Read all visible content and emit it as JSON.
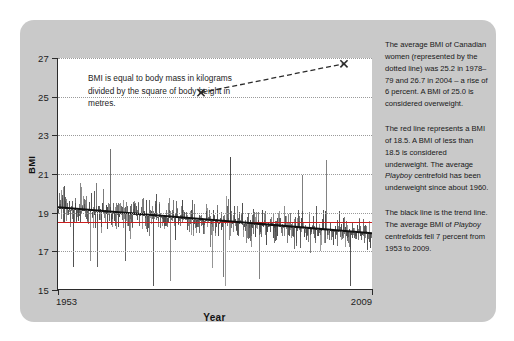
{
  "chart_data": {
    "type": "line",
    "title": "",
    "xlabel": "Year",
    "ylabel": "BMI",
    "xlim": [
      1953,
      2009
    ],
    "ylim": [
      15,
      27
    ],
    "yticks": [
      15,
      17,
      19,
      21,
      23,
      25,
      27
    ],
    "xticks": [
      1953,
      2009
    ],
    "xtick_labels": [
      "1953",
      "2009"
    ],
    "grid": "horizontal dotted gridlines at each y tick",
    "legend": "none (series described in side notes)",
    "series": [
      {
        "name": "Playboy centrefold BMI",
        "style": "dense gray vertical spikes (monthly issues)",
        "color": "#4a4a4a",
        "note": "Fell 7 percent from 1953 to 2009",
        "approx_start_value": 19.2,
        "approx_end_value": 17.9,
        "approx_min_value": 15.2,
        "approx_max_value": 23.2
      },
      {
        "name": "Underweight threshold",
        "style": "horizontal line",
        "color": "#cc1f1f",
        "value": 18.5
      },
      {
        "name": "Trend line",
        "style": "straight black line",
        "color": "#111111",
        "start": {
          "x": 1953,
          "y": 19.25
        },
        "end": {
          "x": 2009,
          "y": 17.9
        }
      },
      {
        "name": "Average BMI of Canadian women",
        "style": "dotted line with X markers",
        "color": "#2b2b2b",
        "points": [
          {
            "label": "1978–79",
            "x": 1978.5,
            "y": 25.2
          },
          {
            "label": "2004",
            "x": 2004,
            "y": 26.7
          }
        ]
      }
    ],
    "annotation": "BMI is equal to body mass in kilograms divided by the square of body height in metres."
  },
  "axes": {
    "y_label": "BMI",
    "x_label": "Year",
    "y_ticks": [
      "27",
      "25",
      "23",
      "21",
      "19",
      "17",
      "15"
    ],
    "x_ticks": [
      "1953",
      "2009"
    ]
  },
  "annotation_box": {
    "text": "BMI is equal to body mass in kilograms divided by the square of body height in metres."
  },
  "side_notes": [
    {
      "id": "canadian-women-note",
      "segments": [
        {
          "text": "The average BMI of Canadian women (represented by the dotted line) was 25.2 in 1978–79 and 26.7 in 2004 – a rise of 6 percent. A BMI of 25.0 is considered overweight.",
          "italic": false
        }
      ]
    },
    {
      "id": "red-line-note",
      "segments": [
        {
          "text": "The red line represents a BMI of 18.5. A BMI of less than 18.5 is considered underweight. The average ",
          "italic": false
        },
        {
          "text": "Playboy",
          "italic": true
        },
        {
          "text": " centrefold has been underweight since about 1960.",
          "italic": false
        }
      ]
    },
    {
      "id": "trend-line-note",
      "segments": [
        {
          "text": "The black line is the trend line. The average BMI of ",
          "italic": false
        },
        {
          "text": "Playboy",
          "italic": true
        },
        {
          "text": " centrefolds fell 7 percent from 1953 to 2009.",
          "italic": false
        }
      ]
    }
  ],
  "colors": {
    "card_background": "#c9c9c9",
    "plot_background": "#ffffff",
    "axis": "#2b2b2b",
    "gridline": "#9a9a9a",
    "spike": "#4a4a4a",
    "trend_line": "#111111",
    "red_line": "#cc1f1f",
    "dotted_line": "#2b2b2b",
    "text": "#171717"
  }
}
